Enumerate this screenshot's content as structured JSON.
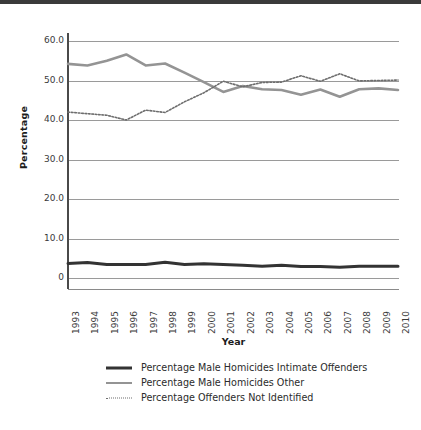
{
  "figure": {
    "background_color": "#ffffff",
    "scan_artifact_top_band_color": "#3a3a3a"
  },
  "colors": {
    "intimate_offenders": "#333333",
    "other": "#949494",
    "not_identified": "#6e6e6e",
    "gridline": "#9a9a9a",
    "axis": "#4a4a4a",
    "text": "#2b2b2b"
  },
  "chart_data": {
    "type": "line",
    "title": "",
    "xlabel": "Year",
    "ylabel": "Percentage",
    "xlim": [
      1993,
      2010
    ],
    "ylim": [
      0,
      60
    ],
    "yticks": [
      0,
      10,
      20,
      30,
      40,
      50,
      60
    ],
    "ytick_labels": [
      "0",
      "10.0",
      "20.0",
      "30.0",
      "40.0",
      "50.0",
      "60.0"
    ],
    "grid": true,
    "grid_axis": "y",
    "legend_position": "bottom",
    "categories": [
      1993,
      1994,
      1995,
      1996,
      1997,
      1998,
      1999,
      2000,
      2001,
      2002,
      2003,
      2004,
      2005,
      2006,
      2007,
      2008,
      2009,
      2010
    ],
    "xtick_labels": [
      "1993",
      "1994",
      "1995",
      "1996",
      "1997",
      "1998",
      "1999",
      "2000",
      "2001",
      "2002",
      "2003",
      "2004",
      "2005",
      "2006",
      "2007",
      "2008",
      "2009",
      "2010"
    ],
    "series": [
      {
        "name": "Percentage Male Homicides Intimate Offenders",
        "style": "solid",
        "color": "#333333",
        "width": 3,
        "values": [
          3.7,
          3.9,
          3.4,
          3.4,
          3.4,
          4.0,
          3.4,
          3.6,
          3.4,
          3.2,
          3.0,
          3.2,
          2.9,
          2.9,
          2.7,
          3.0,
          3.0,
          3.0
        ]
      },
      {
        "name": "Percentage Male Homicides Other",
        "style": "solid",
        "color": "#949494",
        "width": 2.6,
        "values": [
          54.2,
          53.8,
          55.0,
          56.6,
          53.8,
          54.3,
          52.0,
          49.6,
          47.1,
          48.6,
          47.8,
          47.6,
          46.4,
          47.7,
          45.9,
          47.8,
          48.0,
          47.6
        ]
      },
      {
        "name": "Percentage Offenders Not Identified",
        "style": "dotted",
        "color": "#6e6e6e",
        "width": 1.6,
        "values": [
          42.0,
          41.6,
          41.2,
          40.0,
          42.5,
          41.9,
          44.6,
          46.9,
          49.8,
          48.4,
          49.5,
          49.6,
          51.2,
          49.8,
          51.7,
          49.9,
          50.0,
          50.1
        ]
      }
    ]
  },
  "legend": {
    "items": [
      {
        "label": "Percentage Male Homicides Intimate Offenders",
        "swatch": "line-solid-dark-icon"
      },
      {
        "label": "Percentage Male Homicides Other",
        "swatch": "line-solid-gray-icon"
      },
      {
        "label": "Percentage Offenders Not Identified",
        "swatch": "line-dotted-icon"
      }
    ]
  }
}
